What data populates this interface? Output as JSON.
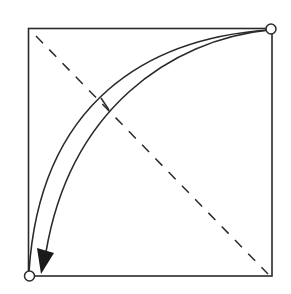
{
  "diagram": {
    "type": "geometric-fold-diagram",
    "colors": {
      "stroke": "#2a2a2a",
      "background": "#ffffff",
      "arrowhead": "#1a1a1a"
    },
    "square": {
      "x": 28,
      "y": 28,
      "width": 244,
      "height": 248
    },
    "points": [
      {
        "name": "top-right-corner",
        "x": 271,
        "y": 29
      },
      {
        "name": "bottom-left-corner",
        "x": 29,
        "y": 276
      }
    ],
    "diagonal": {
      "x1": 36,
      "y1": 36,
      "x2": 268,
      "y2": 274,
      "style": "dashed"
    },
    "arrow": {
      "from": "top-right-corner",
      "to": "bottom-left-corner",
      "style": "double-curved"
    }
  }
}
